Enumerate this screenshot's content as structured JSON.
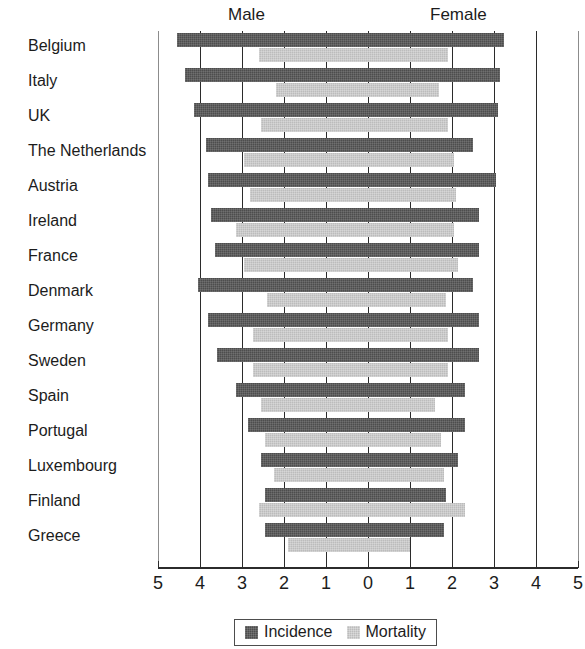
{
  "chart_data": {
    "type": "bar",
    "orientation": "horizontal-diverging",
    "title": "",
    "subtitle": "",
    "xlabel": "",
    "ylabel": "",
    "group_headings": [
      "Male",
      "Female"
    ],
    "legend": {
      "position": "bottom",
      "entries": [
        {
          "name": "Incidence",
          "color": "#4d4d4d"
        },
        {
          "name": "Mortality",
          "color": "#bcbcbc"
        }
      ]
    },
    "grid": true,
    "axis": {
      "tick_labels": [
        "5",
        "4",
        "3",
        "2",
        "1",
        "0",
        "1",
        "2",
        "3",
        "4",
        "5"
      ],
      "tick_values": [
        -5,
        -4,
        -3,
        -2,
        -1,
        0,
        1,
        2,
        3,
        4,
        5
      ],
      "xlim": [
        -5,
        5
      ],
      "left_side": "Male",
      "right_side": "Female"
    },
    "categories": [
      "Belgium",
      "Italy",
      "UK",
      "The Netherlands",
      "Austria",
      "Ireland",
      "France",
      "Denmark",
      "Germany",
      "Sweden",
      "Spain",
      "Portugal",
      "Luxembourg",
      "Finland",
      "Greece"
    ],
    "series": [
      {
        "name": "Incidence",
        "male": [
          4.55,
          4.35,
          4.15,
          3.85,
          3.8,
          3.75,
          3.65,
          4.05,
          3.8,
          3.6,
          3.15,
          2.85,
          2.55,
          2.45,
          2.45
        ],
        "female": [
          3.25,
          3.15,
          3.1,
          2.5,
          3.05,
          2.65,
          2.65,
          2.5,
          2.65,
          2.65,
          2.3,
          2.3,
          2.15,
          1.85,
          1.8
        ]
      },
      {
        "name": "Mortality",
        "male": [
          2.6,
          2.2,
          2.55,
          2.95,
          2.8,
          3.15,
          2.95,
          2.4,
          2.75,
          2.75,
          2.55,
          2.45,
          2.25,
          2.6,
          1.9
        ],
        "female": [
          1.9,
          1.7,
          1.9,
          2.05,
          2.1,
          2.05,
          2.15,
          1.85,
          1.9,
          1.9,
          1.6,
          1.75,
          1.8,
          2.3,
          1.0
        ]
      }
    ]
  }
}
